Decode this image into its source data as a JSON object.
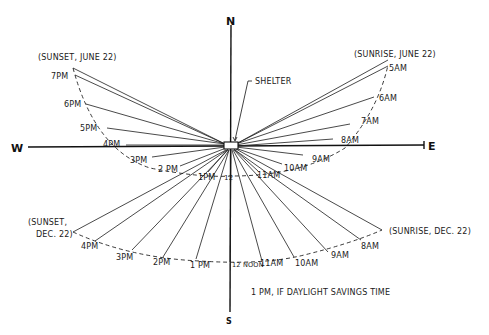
{
  "diagram": {
    "compass": {
      "north": "N",
      "south": "S",
      "west": "W",
      "east": "E"
    },
    "shelter_label": "SHELTER",
    "note": "1 PM, IF DAYLIGHT SAVINGS TIME",
    "june": {
      "sunset_label": "(SUNSET, JUNE 22)",
      "sunrise_label": "(SUNRISE, JUNE 22)",
      "hours": [
        "5AM",
        "6AM",
        "7AM",
        "8AM",
        "9AM",
        "10AM",
        "11AM",
        "12",
        "1PM",
        "2 PM",
        "3PM",
        "4PM",
        "5PM",
        "6PM",
        "7PM"
      ]
    },
    "december": {
      "sunset_label_line1": "(SUNSET,",
      "sunset_label_line2": "DEC. 22)",
      "sunrise_label": "(SUNRISE, DEC. 22)",
      "hours": [
        "8AM",
        "9AM",
        "10AM",
        "11AM",
        "12 NOON",
        "1 PM",
        "2PM",
        "3PM",
        "4PM"
      ]
    },
    "colors": {
      "ink": "#1a1a1a",
      "background": "#ffffff"
    }
  }
}
